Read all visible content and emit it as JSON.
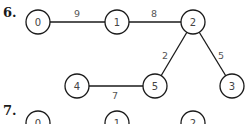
{
  "problems": [
    {
      "label": "6.",
      "nodes": [
        {
          "id": "0",
          "x": 38,
          "y": 22
        },
        {
          "id": "1",
          "x": 117,
          "y": 22
        },
        {
          "id": "2",
          "x": 193,
          "y": 22
        },
        {
          "id": "4",
          "x": 77,
          "y": 86
        },
        {
          "id": "5",
          "x": 155,
          "y": 86
        },
        {
          "id": "3",
          "x": 232,
          "y": 86
        }
      ],
      "edges": [
        {
          "from": "0",
          "to": "1",
          "weight": "9",
          "lx": 77,
          "ly": 13
        },
        {
          "from": "1",
          "to": "2",
          "weight": "8",
          "lx": 154,
          "ly": 13
        },
        {
          "from": "2",
          "to": "5",
          "weight": "2",
          "lx": 165,
          "ly": 55
        },
        {
          "from": "2",
          "to": "3",
          "weight": "5",
          "lx": 221,
          "ly": 55
        },
        {
          "from": "4",
          "to": "5",
          "weight": "7",
          "lx": 115,
          "ly": 95
        }
      ]
    },
    {
      "label": "7.",
      "nodes": [
        {
          "id": "0",
          "x": 38,
          "y": 123
        },
        {
          "id": "1",
          "x": 117,
          "y": 123
        },
        {
          "id": "2",
          "x": 193,
          "y": 123
        }
      ],
      "edges": []
    }
  ]
}
